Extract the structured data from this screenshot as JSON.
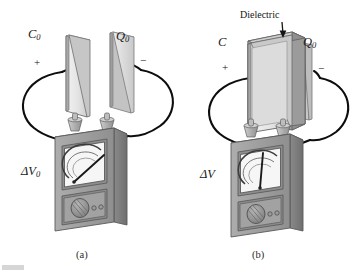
{
  "figure": {
    "background_color": "#ffffff",
    "panels": [
      {
        "id": "a",
        "caption": "(a)",
        "capacitor_label": "C",
        "capacitor_label_sub": "0",
        "charge_label": "Q",
        "charge_label_sub": "0",
        "plus_sign": "+",
        "minus_sign": "−",
        "meter_label": "ΔV",
        "meter_label_sub": "0",
        "has_dielectric": false,
        "needle_angle_deg": 38,
        "description": "Parallel-plate capacitor with air gap connected to a voltmeter reading delta V naught"
      },
      {
        "id": "b",
        "caption": "(b)",
        "capacitor_label": "C",
        "capacitor_label_sub": "",
        "charge_label": "Q",
        "charge_label_sub": "0",
        "plus_sign": "+",
        "minus_sign": "−",
        "meter_label": "ΔV",
        "meter_label_sub": "",
        "has_dielectric": true,
        "dielectric_label": "Dielectric",
        "needle_angle_deg": 6,
        "description": "Same capacitor with a dielectric slab inserted; voltmeter reads a smaller delta V"
      }
    ],
    "colors": {
      "plate_face": "#e9e9e9",
      "plate_edge": "#8d8d8d",
      "plate_shadow": "#b9b9b9",
      "dielectric_face": "#a6a6a6",
      "dielectric_side": "#8f8f8f",
      "dielectric_top": "#c2c2c2",
      "meter_body": "#9e9e9e",
      "meter_body_side": "#7d7d7d",
      "meter_top": "#bdbdbd",
      "gauge_face": "#f4f4f4",
      "wire": "#0d0d0d",
      "outline": "#4a4a4a",
      "knob": "#8a8a8a",
      "text": "#1a1a1a"
    }
  }
}
